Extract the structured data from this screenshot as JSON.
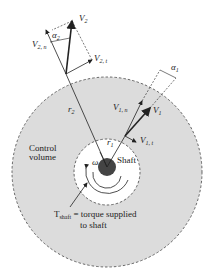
{
  "diagram": {
    "labels": {
      "v2": "V",
      "v2_sub": "2",
      "v2n": "V",
      "v2n_sub": "2, n",
      "v2t": "V",
      "v2t_sub": "2, t",
      "alpha2": "α",
      "alpha2_sub": "2",
      "alpha1": "α",
      "alpha1_sub": "1",
      "v1": "V",
      "v1_sub": "1",
      "v1n": "V",
      "v1n_sub": "1, n",
      "v1t": "V",
      "v1t_sub": "1, t",
      "r2": "r",
      "r2_sub": "2",
      "r1": "r",
      "r1_sub": "1",
      "control_volume_line1": "Control",
      "control_volume_line2": "volume",
      "omega": "ω",
      "shaft": "Shaft",
      "tshaft": "T",
      "tshaft_sub": "shaft",
      "torque_line1": " = torque supplied",
      "torque_line2": "to shaft"
    },
    "colors": {
      "control_volume_fill": "#d9d9d9",
      "shaft_fill": "#444444",
      "line": "#222222"
    }
  }
}
